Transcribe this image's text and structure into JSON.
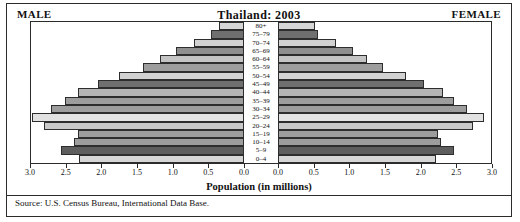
{
  "header": {
    "male_label": "MALE",
    "female_label": "FEMALE",
    "title": "Thailand: 2003"
  },
  "footer": {
    "source": "Source: U.S. Census Bureau, International Data Base."
  },
  "axis": {
    "title": "Population (in millions)",
    "tick_labels": [
      "3.0",
      "2.5",
      "2.0",
      "1.5",
      "1.0",
      "0.5",
      "0.0",
      "0.0",
      "0.5",
      "1.0",
      "1.5",
      "2.0",
      "2.5",
      "3.0"
    ]
  },
  "chart_data": {
    "type": "bar",
    "subtype": "population-pyramid",
    "title": "Thailand: 2003",
    "xlabel": "Population (in millions)",
    "ylabel": "",
    "xlim": [
      0,
      3.0
    ],
    "xticks": [
      0.0,
      0.5,
      1.0,
      1.5,
      2.0,
      2.5,
      3.0
    ],
    "grid": false,
    "legend": [
      "MALE",
      "FEMALE"
    ],
    "legend_position": "top-left-and-top-right",
    "categories": [
      "0-4",
      "5-9",
      "10-14",
      "15-19",
      "20-24",
      "25-29",
      "30-34",
      "35-39",
      "40-44",
      "45-49",
      "50-54",
      "55-59",
      "60-64",
      "65-69",
      "70-74",
      "75-79",
      "80+"
    ],
    "series": [
      {
        "name": "MALE",
        "side": "left",
        "values": [
          2.32,
          2.58,
          2.4,
          2.34,
          2.82,
          2.98,
          2.72,
          2.52,
          2.34,
          2.06,
          1.76,
          1.42,
          1.18,
          0.96,
          0.7,
          0.46,
          0.36
        ]
      },
      {
        "name": "FEMALE",
        "side": "right",
        "values": [
          2.22,
          2.48,
          2.3,
          2.26,
          2.74,
          2.9,
          2.66,
          2.48,
          2.32,
          2.06,
          1.8,
          1.48,
          1.26,
          1.06,
          0.82,
          0.56,
          0.52
        ]
      }
    ],
    "bar_colors": [
      "#d6d6d6",
      "#5e5e5e",
      "#9d9d9d",
      "#9d9d9d",
      "#c9c9c9",
      "#e2e2e2",
      "#9d9d9d",
      "#9d9d9d",
      "#b5b5b5",
      "#6f6f6f",
      "#d2d2d2",
      "#9d9d9d",
      "#c4c4c4",
      "#8f8f8f",
      "#d2d2d2",
      "#6f6f6f",
      "#d6d6d6"
    ]
  }
}
